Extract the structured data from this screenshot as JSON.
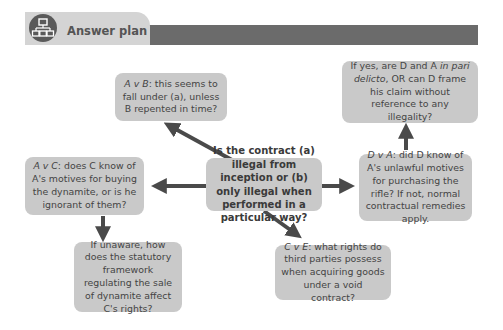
{
  "header": {
    "icon": "hierarchy-diagram-icon",
    "title": "Answer plan"
  },
  "nodes": {
    "central": {
      "text": "Is the contract (a) illegal from inception or (b) only illegal when performed in a particular way?"
    },
    "a_v_b": {
      "label": "A v B",
      "text": ": this seems to fall under (a), unless B repented in time?"
    },
    "a_v_c": {
      "label": "A v C",
      "text": ": does C know of A's motives for buying the dynamite, or is he ignorant of them?"
    },
    "unaware": {
      "text": "If unaware, how does the statutory framework regulating the sale of dynamite affect C's rights?"
    },
    "c_v_e": {
      "label": "C v E",
      "text": ": what rights do third parties possess when acquiring goods under a void contract?"
    },
    "d_v_a": {
      "label": "D v A",
      "text": ": did D know of A's unlawful motives for purchasing the rifle? If not, normal contractual remedies apply."
    },
    "in_pari": {
      "pre": "If yes, are D and A ",
      "italic": "in pari delicto",
      "post": ", OR can D frame his claim without reference to any illegality?"
    }
  },
  "colors": {
    "box_fill": "#c9c9c9",
    "arrow": "#4a4a4a",
    "header_bar": "#6b6b6b",
    "header_tab": "#d4d4d4"
  }
}
